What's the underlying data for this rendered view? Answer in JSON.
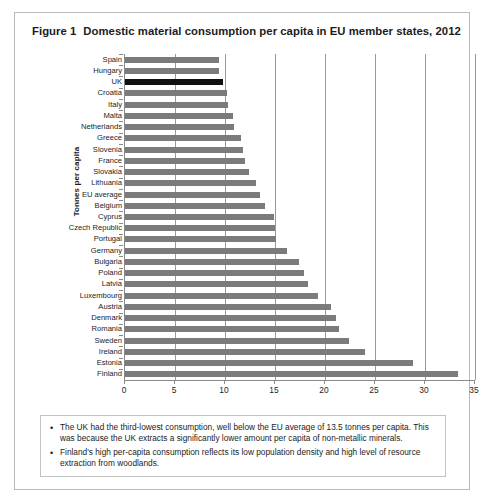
{
  "figure": {
    "number": "Figure 1",
    "title": "Domestic material consumption per capita in EU member states, 2012"
  },
  "colors": {
    "bar": "#7b7b7b",
    "bar_highlight": "#111111",
    "gridline": "#9a9a9a",
    "axis": "#8a8a8a",
    "frame": "#b9b9b9",
    "text": "#1c1c1c"
  },
  "chart_data": {
    "type": "bar",
    "orientation": "horizontal",
    "title": "Domestic material consumption per capita in EU member states, 2012",
    "xlabel": "",
    "ylabel": "Tonnes per capita",
    "xlim": [
      0,
      35
    ],
    "xticks": [
      0,
      5,
      10,
      15,
      20,
      25,
      30,
      35
    ],
    "grid": true,
    "legend": "none",
    "highlight_category": "UK",
    "categories": [
      "Spain",
      "Hungary",
      "UK",
      "Croatia",
      "Italy",
      "Malta",
      "Netherlands",
      "Greece",
      "Slovenia",
      "France",
      "Slovakia",
      "Lithuania",
      "EU average",
      "Belgium",
      "Cyprus",
      "Czech Republic",
      "Portugal",
      "Germany",
      "Bulgaria",
      "Poland",
      "Latvia",
      "Luxembourg",
      "Austria",
      "Denmark",
      "Romania",
      "Sweden",
      "Ireland",
      "Estonia",
      "Finland"
    ],
    "values": [
      9.4,
      9.4,
      9.8,
      10.2,
      10.3,
      10.8,
      10.9,
      11.6,
      11.8,
      12.0,
      12.4,
      13.1,
      13.5,
      14.0,
      14.9,
      15.0,
      15.1,
      16.2,
      17.4,
      17.9,
      18.3,
      19.3,
      20.6,
      21.1,
      21.4,
      22.4,
      24.0,
      28.8,
      33.3
    ]
  },
  "notes": [
    {
      "bullet": "•",
      "text": "The UK had the third-lowest consumption, well below the EU average of 13.5 tonnes per capita. This was because the UK extracts a significantly lower amount per capita of non-metallic minerals."
    },
    {
      "bullet": "•",
      "text": "Finland's high per-capita consumption reflects its low population density and high level of resource extraction from woodlands."
    }
  ]
}
